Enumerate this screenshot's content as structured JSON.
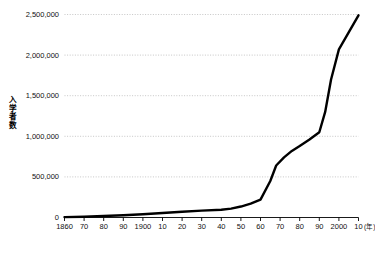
{
  "chart_data": {
    "type": "line",
    "title": "",
    "subtitle": "",
    "xlabel": "",
    "ylabel": "入学者数",
    "x_unit_label": "(年)",
    "xlim": [
      1860,
      2010
    ],
    "ylim": [
      0,
      2500000
    ],
    "grid": true,
    "grid_axis": "y",
    "legend": "none",
    "y_ticks": [
      0,
      500000,
      1000000,
      1500000,
      2000000,
      2500000
    ],
    "y_tick_labels": [
      "0",
      "500,000",
      "1,000,000",
      "1,500,000",
      "2,000,000",
      "2,500,000"
    ],
    "x_ticks": [
      1860,
      1870,
      1880,
      1890,
      1900,
      1910,
      1920,
      1930,
      1940,
      1950,
      1960,
      1970,
      1980,
      1990,
      2000,
      2010
    ],
    "x_tick_labels": [
      "1860",
      "70",
      "80",
      "90",
      "1900",
      "10",
      "20",
      "30",
      "40",
      "50",
      "60",
      "70",
      "80",
      "90",
      "2000",
      "10"
    ],
    "series": [
      {
        "name": "入学者数",
        "color": "#000000",
        "line_width": 2.4,
        "x": [
          1860,
          1870,
          1880,
          1890,
          1900,
          1910,
          1920,
          1930,
          1940,
          1945,
          1950,
          1955,
          1960,
          1965,
          1968,
          1972,
          1976,
          1980,
          1985,
          1990,
          1993,
          1996,
          2000,
          2005,
          2010
        ],
        "values": [
          5000,
          10000,
          18000,
          28000,
          40000,
          55000,
          70000,
          85000,
          95000,
          110000,
          135000,
          170000,
          220000,
          450000,
          640000,
          740000,
          820000,
          880000,
          960000,
          1050000,
          1300000,
          1700000,
          2070000,
          2280000,
          2490000
        ]
      }
    ],
    "annotations": []
  },
  "colors": {
    "line": "#000000",
    "grid": "#b8b8b8",
    "axis": "#000000",
    "text": "#111111",
    "background": "#ffffff"
  }
}
